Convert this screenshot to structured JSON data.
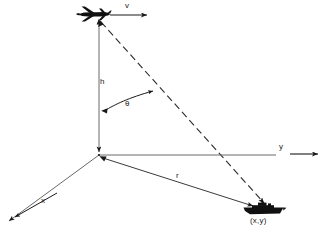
{
  "diagram": {
    "labels": {
      "velocity": "v",
      "altitude": "h",
      "angle": "θ",
      "y_axis": "y",
      "x_axis": "x",
      "range": "r",
      "ship_position": "(x,y)"
    },
    "icons": {
      "aircraft": "aircraft-silhouette",
      "ship": "ship-silhouette"
    },
    "colors": {
      "ink": "#1a1a1a",
      "line": "#4a4a4a",
      "background": "#ffffff"
    },
    "geometry": {
      "origin": [
        99,
        155
      ],
      "aircraft_center": [
        94,
        15
      ],
      "ship_center": [
        263,
        209
      ],
      "altitude_line": [
        [
          99,
          21
        ],
        [
          99,
          155
        ]
      ],
      "velocity_arrow": [
        [
          110,
          15
        ],
        [
          150,
          15
        ]
      ],
      "y_axis_line": [
        [
          99,
          155
        ],
        [
          276,
          155
        ]
      ],
      "y_axis_arrow": [
        [
          289,
          154
        ],
        [
          320,
          154
        ]
      ],
      "x_axis_line": [
        [
          99,
          155
        ],
        [
          8,
          222
        ]
      ],
      "x_axis_tick_arrow": [
        [
          56,
          194
        ],
        [
          12,
          219
        ]
      ],
      "range_line": [
        [
          100,
          157
        ],
        [
          256,
          207
        ]
      ],
      "slant_dashed_line": [
        [
          100,
          21
        ],
        [
          268,
          205
        ]
      ],
      "angle_arc": [
        [
          103,
          110
        ],
        [
          155,
          90
        ]
      ]
    }
  }
}
